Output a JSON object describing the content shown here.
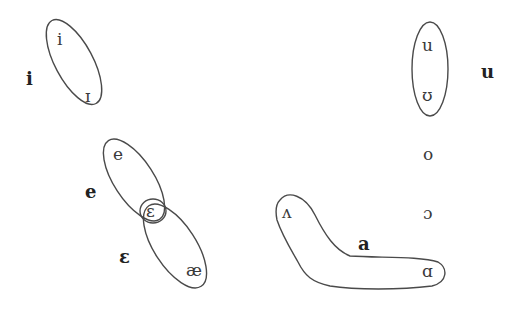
{
  "diagram": {
    "type": "vowel-merger-chart",
    "categories": [
      {
        "id": "i",
        "label": "i",
        "members": [
          "i",
          "ɪ"
        ]
      },
      {
        "id": "e",
        "label": "e",
        "members": [
          "e",
          "ɛ"
        ]
      },
      {
        "id": "eps",
        "label": "ɛ",
        "members": [
          "ɛ",
          "æ"
        ]
      },
      {
        "id": "a",
        "label": "a",
        "members": [
          "ʌ",
          "ɑ"
        ]
      },
      {
        "id": "u",
        "label": "u",
        "members": [
          "u",
          "ʊ"
        ]
      }
    ],
    "symbols": {
      "i": "i",
      "ih": "ɪ",
      "e": "e",
      "eh": "ɛ",
      "ae": "æ",
      "uh": "ʌ",
      "aa": "ɑ",
      "u": "u",
      "uu": "ʊ",
      "o": "o",
      "oo": "ɔ"
    },
    "labels": {
      "i": "i",
      "e": "e",
      "eps": "ɛ",
      "a": "a",
      "u": "u"
    }
  }
}
